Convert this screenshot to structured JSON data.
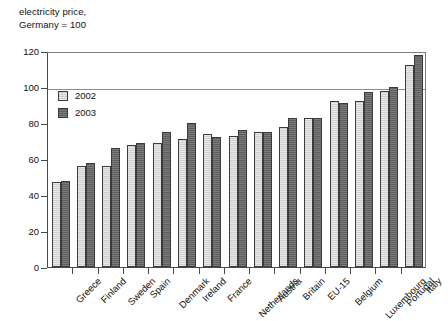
{
  "chart_data": {
    "type": "bar",
    "title_line1": "electricity price,",
    "title_line2": "Germany = 100",
    "xlabel": "",
    "ylabel": "",
    "ylim": [
      0,
      120
    ],
    "yticks": [
      0,
      20,
      40,
      60,
      80,
      100,
      120
    ],
    "ytick_labels": [
      "0",
      "20",
      "40",
      "60",
      "80",
      "100",
      "120"
    ],
    "grid": true,
    "gridlines_at": [
      100,
      120
    ],
    "legend_position": "upper left (inside plot)",
    "categories": [
      "Greece",
      "Finland",
      "Sweden",
      "Spain",
      "Denmark",
      "Ireland",
      "France",
      "Netherlands",
      "Austria",
      "Britain",
      "EU-15",
      "Belgium",
      "Luxembourg",
      "Portugal",
      "Italy"
    ],
    "series": [
      {
        "name": "2002",
        "color": "#cfcfcf",
        "values": [
          47,
          56,
          56,
          68,
          69,
          71,
          74,
          73,
          75,
          78,
          83,
          92,
          92,
          98,
          112
        ]
      },
      {
        "name": "2003",
        "color": "#5e5e5e",
        "values": [
          48,
          58,
          66,
          69,
          75,
          80,
          72,
          76,
          75,
          83,
          83,
          91,
          97,
          100,
          118
        ]
      }
    ]
  },
  "legend": {
    "items": [
      {
        "label": "2002"
      },
      {
        "label": "2003"
      }
    ]
  }
}
